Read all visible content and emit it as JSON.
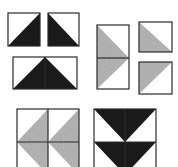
{
  "figure": {
    "colors": {
      "background": "#ffffff",
      "dark": "#1a1a1a",
      "medium": "#a9a9a9",
      "outline": "#2a2a2a"
    },
    "units": [
      {
        "name": "hst-square-left",
        "rect": [
          8,
          13,
          32,
          33
        ],
        "triangles": [
          {
            "points": [
              [
                8,
                46
              ],
              [
                40,
                13
              ],
              [
                40,
                46
              ]
            ],
            "fill": "dark"
          }
        ]
      },
      {
        "name": "hst-square-right",
        "rect": [
          48,
          13,
          31,
          33
        ],
        "triangles": [
          {
            "points": [
              [
                48,
                13
              ],
              [
                48,
                46
              ],
              [
                79,
                46
              ]
            ],
            "fill": "dark"
          }
        ]
      },
      {
        "name": "flying-goose-dark",
        "rect": [
          13,
          57,
          64,
          32
        ],
        "triangles": [
          {
            "points": [
              [
                13,
                89
              ],
              [
                45,
                57
              ],
              [
                77,
                89
              ]
            ],
            "fill": "dark"
          }
        ],
        "seams": [
          [
            [
              45,
              57
            ],
            [
              45,
              89
            ]
          ]
        ]
      },
      {
        "name": "tall-unit-gray",
        "rect": [
          97,
          25,
          32,
          64
        ],
        "triangles": [
          {
            "points": [
              [
                97,
                25
              ],
              [
                129,
                58
              ],
              [
                97,
                58
              ]
            ],
            "fill": "medium"
          },
          {
            "points": [
              [
                97,
                58
              ],
              [
                129,
                58
              ],
              [
                97,
                89
              ]
            ],
            "fill": "medium"
          }
        ],
        "seams": [
          [
            [
              97,
              58
            ],
            [
              129,
              58
            ]
          ]
        ]
      },
      {
        "name": "hst-square-gray-top",
        "rect": [
          139,
          22,
          33,
          30
        ],
        "triangles": [
          {
            "points": [
              [
                139,
                22
              ],
              [
                172,
                52
              ],
              [
                139,
                52
              ]
            ],
            "fill": "medium"
          }
        ]
      },
      {
        "name": "hst-square-gray-bottom",
        "rect": [
          139,
          62,
          33,
          32
        ],
        "triangles": [
          {
            "points": [
              [
                139,
                62
              ],
              [
                172,
                62
              ],
              [
                139,
                94
              ]
            ],
            "fill": "medium"
          }
        ]
      },
      {
        "name": "block-gray-arrows-left",
        "rect": [
          17,
          109,
          62,
          66
        ],
        "triangles": [
          {
            "points": [
              [
                48,
                109
              ],
              [
                17,
                142
              ],
              [
                48,
                175
              ]
            ],
            "fill": "medium"
          },
          {
            "points": [
              [
                79,
                109
              ],
              [
                48,
                142
              ],
              [
                79,
                175
              ]
            ],
            "fill": "medium"
          }
        ],
        "seams": [
          [
            [
              48,
              109
            ],
            [
              48,
              175
            ]
          ],
          [
            [
              17,
              142
            ],
            [
              79,
              142
            ]
          ]
        ]
      },
      {
        "name": "block-dark-arrows-down",
        "rect": [
          94,
          109,
          62,
          66
        ],
        "triangles": [
          {
            "points": [
              [
                94,
                109
              ],
              [
                156,
                109
              ],
              [
                125,
                142
              ]
            ],
            "fill": "dark"
          },
          {
            "points": [
              [
                94,
                142
              ],
              [
                156,
                142
              ],
              [
                125,
                175
              ]
            ],
            "fill": "dark"
          }
        ],
        "seams": [
          [
            [
              125,
              109
            ],
            [
              125,
              175
            ]
          ],
          [
            [
              94,
              142
            ],
            [
              156,
              142
            ]
          ]
        ]
      }
    ]
  }
}
